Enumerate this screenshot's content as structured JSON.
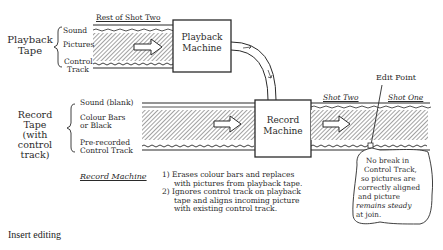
{
  "diagram": {
    "playback_tape": {
      "label_lines": [
        "Playback",
        "Tape"
      ],
      "tracks": [
        "Sound",
        "Pictures",
        "Control",
        "Track"
      ],
      "header": "Rest of Shot Two"
    },
    "playback_machine": {
      "label_lines": [
        "Playback",
        "Machine"
      ]
    },
    "record_tape": {
      "label_lines": [
        "Record",
        "Tape",
        "(with control",
        "track)"
      ],
      "tracks": [
        "Sound (blank)",
        "Colour Bars",
        "or Black",
        "Pre-recorded",
        "Control Track"
      ]
    },
    "record_machine": {
      "label_lines": [
        "Record",
        "Machine"
      ]
    },
    "output_tape": {
      "shot_two": "Shot Two",
      "shot_one": "Shot One",
      "edit_point": "Edit Point"
    },
    "record_machine_notes": {
      "heading": "Record Machine",
      "items": [
        "1) Erases colour bars and replaces",
        "with pictures from playback tape.",
        "2) Ignores control track on playback",
        "tape and aligns incoming picture",
        "with existing control track."
      ]
    },
    "callout": {
      "lines": [
        "No break in",
        "Control Track,",
        "so pictures are",
        "correctly aligned",
        "and picture",
        "remains steady",
        "at join."
      ]
    }
  },
  "caption": "Insert editing",
  "colors": {
    "ink": "#2a2a2a",
    "background": "#ffffff"
  }
}
